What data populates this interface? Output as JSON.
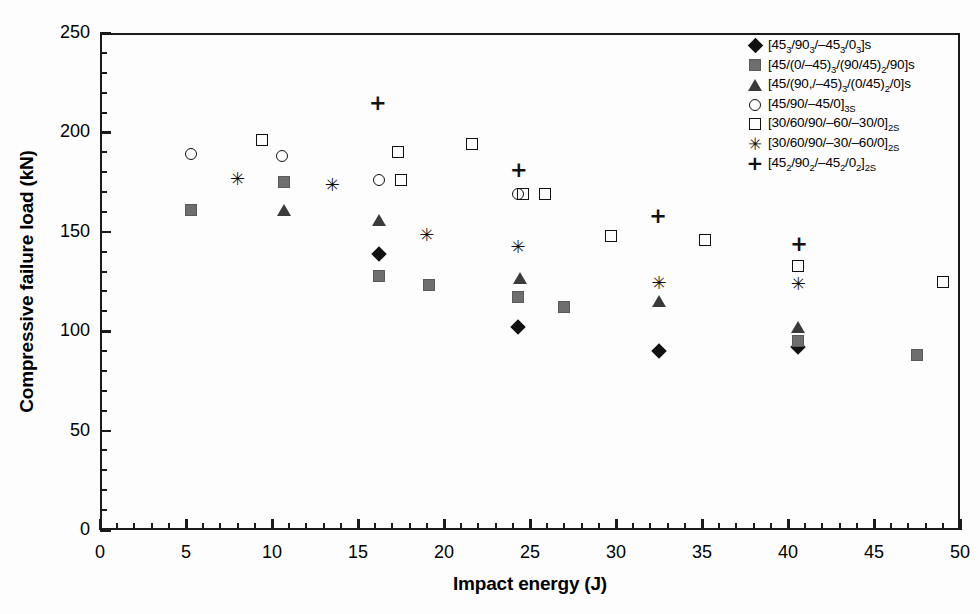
{
  "chart_data": {
    "type": "scatter",
    "title": "",
    "xlabel": "Impact energy (J)",
    "ylabel": "Compressive failure load (kN)",
    "xlim": [
      0,
      50
    ],
    "ylim": [
      0,
      250
    ],
    "xticks": [
      0,
      5,
      10,
      15,
      20,
      25,
      30,
      35,
      40,
      45,
      50
    ],
    "yticks": [
      0,
      50,
      100,
      150,
      200,
      250
    ],
    "x_minor_step": 1,
    "y_minor_step": 10,
    "grid": false,
    "legend_position": "top-right",
    "series": [
      {
        "name": "[45_3/90_3/-45_3/0_3]s",
        "label_html": "[45<sub>3</sub>/90<sub>3</sub>/&#8211;45<sub>3</sub>/0<sub>3</sub>]s",
        "marker": "filled-diamond",
        "color": "#111111",
        "points": [
          {
            "x": 16.2,
            "y": 139
          },
          {
            "x": 24.3,
            "y": 102
          },
          {
            "x": 32.5,
            "y": 90
          },
          {
            "x": 40.6,
            "y": 92
          }
        ]
      },
      {
        "name": "[45/(0/-45)_3/(90/45)_2/90]s",
        "label_html": "[45/(0/&#8211;45)<sub>3</sub>/(90/45)<sub>2</sub>/90]s",
        "marker": "filled-square",
        "color": "#6e6e6e",
        "points": [
          {
            "x": 5.3,
            "y": 161
          },
          {
            "x": 10.7,
            "y": 175
          },
          {
            "x": 16.2,
            "y": 128
          },
          {
            "x": 19.1,
            "y": 123
          },
          {
            "x": 24.3,
            "y": 117
          },
          {
            "x": 27.0,
            "y": 112
          },
          {
            "x": 40.6,
            "y": 95
          },
          {
            "x": 47.5,
            "y": 88
          }
        ]
      },
      {
        "name": "[45/(90,/-45)_3/(0/45)_2/0]s",
        "label_html": "[45/(90,/&#8211;45)<sub>3</sub>/(0/45)<sub>2</sub>/0]s",
        "marker": "filled-triangle",
        "color": "#3a3a3a",
        "points": [
          {
            "x": 10.7,
            "y": 161
          },
          {
            "x": 16.2,
            "y": 156
          },
          {
            "x": 24.4,
            "y": 127
          },
          {
            "x": 32.5,
            "y": 115
          },
          {
            "x": 40.6,
            "y": 102
          }
        ]
      },
      {
        "name": "[45/90/-45/0]_3S",
        "label_html": "[45/90/&#8211;45/0]<sub>3S</sub>",
        "marker": "open-circle",
        "color": "#111111",
        "points": [
          {
            "x": 5.3,
            "y": 189
          },
          {
            "x": 10.6,
            "y": 188
          },
          {
            "x": 16.2,
            "y": 176
          },
          {
            "x": 24.3,
            "y": 169
          }
        ]
      },
      {
        "name": "[30/60/90/-60/-30/0]_2S",
        "label_html": "[30/60/90/&#8211;60/&#8211;30/0]<sub>2S</sub>",
        "marker": "open-square",
        "color": "#111111",
        "points": [
          {
            "x": 9.4,
            "y": 196
          },
          {
            "x": 17.3,
            "y": 190
          },
          {
            "x": 17.5,
            "y": 176
          },
          {
            "x": 21.6,
            "y": 194
          },
          {
            "x": 24.6,
            "y": 169
          },
          {
            "x": 25.9,
            "y": 169
          },
          {
            "x": 29.7,
            "y": 148
          },
          {
            "x": 35.2,
            "y": 146
          },
          {
            "x": 40.6,
            "y": 133
          },
          {
            "x": 49.0,
            "y": 125
          }
        ]
      },
      {
        "name": "[30/60/90/-30/-60/0]_2S",
        "label_html": "[30/60/90/&#8211;30/&#8211;60/0]<sub>2S</sub>",
        "marker": "star",
        "color": "#111111",
        "glyph": "✳",
        "points": [
          {
            "x": 8.0,
            "y": 177
          },
          {
            "x": 13.5,
            "y": 174
          },
          {
            "x": 19.0,
            "y": 149
          },
          {
            "x": 24.3,
            "y": 143
          },
          {
            "x": 32.5,
            "y": 125
          },
          {
            "x": 40.6,
            "y": 124
          }
        ]
      },
      {
        "name": "[45_2/90_2/-45_2/0_2]_2S",
        "label_html": "[45<sub>2</sub>/90<sub>2</sub>/&#8211;45<sub>2</sub>/0<sub>2</sub>]<sub>2S</sub>",
        "marker": "plus",
        "color": "#111111",
        "glyph": "+",
        "points": [
          {
            "x": 16.1,
            "y": 215
          },
          {
            "x": 24.3,
            "y": 181
          },
          {
            "x": 32.4,
            "y": 158
          },
          {
            "x": 40.6,
            "y": 144
          }
        ]
      }
    ]
  }
}
